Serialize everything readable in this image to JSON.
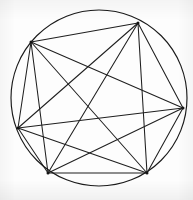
{
  "figure": {
    "type": "geometric-diagram",
    "background_color": "#fdfdfd",
    "stroke_color": "#1f1f1f",
    "circle_stroke_color": "#1a1a1a",
    "stroke_width": 1.05,
    "circle_stroke_width": 1.15,
    "canvas": {
      "width": 193,
      "height": 200
    }
  },
  "circle": {
    "label": "circumscribed-circle",
    "center_x": 99,
    "center_y": 98,
    "radius": 88
  },
  "vertices": [
    {
      "id": "A",
      "label": "top-left",
      "x": 31,
      "y": 42
    },
    {
      "id": "B",
      "label": "top",
      "x": 138,
      "y": 23
    },
    {
      "id": "C",
      "label": "right",
      "x": 183,
      "y": 108
    },
    {
      "id": "D",
      "label": "bottom-right",
      "x": 147,
      "y": 173
    },
    {
      "id": "E",
      "label": "bottom-left",
      "x": 48,
      "y": 173
    },
    {
      "id": "F",
      "label": "left",
      "x": 18,
      "y": 128
    }
  ],
  "chords": [
    {
      "id": "AB",
      "from": "A",
      "to": "B"
    },
    {
      "id": "AC",
      "from": "A",
      "to": "C"
    },
    {
      "id": "AD",
      "from": "A",
      "to": "D"
    },
    {
      "id": "AE",
      "from": "A",
      "to": "E"
    },
    {
      "id": "AF",
      "from": "A",
      "to": "F"
    },
    {
      "id": "BC",
      "from": "B",
      "to": "C"
    },
    {
      "id": "BD",
      "from": "B",
      "to": "D"
    },
    {
      "id": "BE",
      "from": "B",
      "to": "E"
    },
    {
      "id": "BF",
      "from": "B",
      "to": "F"
    },
    {
      "id": "CD",
      "from": "C",
      "to": "D"
    },
    {
      "id": "CE",
      "from": "C",
      "to": "E"
    },
    {
      "id": "CF",
      "from": "C",
      "to": "F"
    },
    {
      "id": "DE",
      "from": "D",
      "to": "E"
    },
    {
      "id": "DF",
      "from": "D",
      "to": "F"
    },
    {
      "id": "EF",
      "from": "E",
      "to": "F"
    }
  ],
  "counts": {
    "vertex_count": 6,
    "chord_count": 15
  }
}
